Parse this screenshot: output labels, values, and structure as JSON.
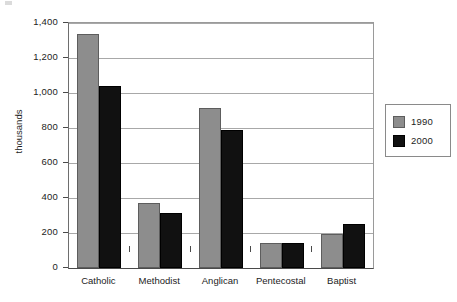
{
  "chart_data": {
    "type": "bar",
    "title": "",
    "subtitle": "",
    "xlabel": "",
    "ylabel": "thousands",
    "categories": [
      "Catholic",
      "Methodist",
      "Anglican",
      "Pentecostal",
      "Baptist"
    ],
    "series": [
      {
        "name": "1990",
        "color": "#8d8d8d",
        "values": [
          1335,
          370,
          915,
          145,
          195
        ]
      },
      {
        "name": "2000",
        "color": "#111111",
        "values": [
          1040,
          315,
          790,
          145,
          250
        ]
      }
    ],
    "ylim": [
      0,
      1400
    ],
    "ytick_values": [
      0,
      200,
      400,
      600,
      800,
      1000,
      1200,
      1400
    ],
    "ytick_labels": [
      "0",
      "200",
      "400",
      "600",
      "800",
      "1,000",
      "1,200",
      "1,400"
    ],
    "grid": "horizontal",
    "legend_position": "right",
    "legend_entries": [
      "1990",
      "2000"
    ],
    "annotations": []
  },
  "colors": {
    "background": "#ffffff",
    "axis": "#4a4a4a",
    "gridline": "#a8a8a8",
    "text": "#1c1c1c",
    "series_1990": "#8d8d8d",
    "series_2000": "#111111",
    "legend_border": "#8a8a8a"
  }
}
